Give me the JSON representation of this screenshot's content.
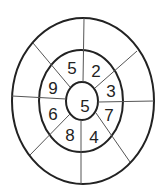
{
  "diagram": {
    "type": "concentric-ellipse-number-wheel",
    "stroke_color": "#222222",
    "center_value": "5",
    "inner_ring_values": {
      "top_left": "5",
      "top_right": "2",
      "upper_right": "3",
      "lower_right": "7",
      "bottom_right": "4",
      "bottom_left": "8",
      "lower_left": "6",
      "upper_left": "9"
    },
    "outer_ring_values": {
      "top_left": "",
      "top_right": "",
      "upper_right": "",
      "lower_right": "",
      "bottom_right": "",
      "bottom_left": "",
      "lower_left": "",
      "upper_left": ""
    },
    "sector_count": 8
  }
}
